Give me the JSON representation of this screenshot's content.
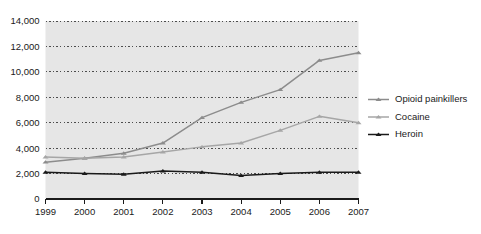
{
  "chart_data": {
    "type": "line",
    "title": "",
    "subtitle": "",
    "xlabel": "",
    "ylabel": "",
    "x": [
      1999,
      2000,
      2001,
      2002,
      2003,
      2004,
      2005,
      2006,
      2007
    ],
    "categories": [
      "1999",
      "2000",
      "2001",
      "2002",
      "2003",
      "2004",
      "2005",
      "2006",
      "2007"
    ],
    "series": [
      {
        "name": "Opioid painkillers",
        "color": "#8c8c8c",
        "marker": "triangle",
        "values": [
          2900,
          3200,
          3600,
          4400,
          6400,
          7600,
          8600,
          10900,
          11500
        ]
      },
      {
        "name": "Cocaine",
        "color": "#a6a6a6",
        "marker": "triangle",
        "values": [
          3300,
          3200,
          3300,
          3700,
          4100,
          4400,
          5400,
          6500,
          6000
        ]
      },
      {
        "name": "Heroin",
        "color": "#1a1a1a",
        "marker": "triangle",
        "values": [
          2100,
          2000,
          1950,
          2200,
          2100,
          1850,
          2000,
          2100,
          2100
        ]
      }
    ],
    "ylim": [
      0,
      14000
    ],
    "yticks": [
      0,
      2000,
      4000,
      6000,
      8000,
      10000,
      12000,
      14000
    ],
    "ytick_labels": [
      "0",
      "2,000",
      "4,000",
      "6,000",
      "8,000",
      "10,000",
      "12,000",
      "14,000"
    ],
    "xtick_labels": [
      "1999",
      "2000",
      "2001",
      "2002",
      "2003",
      "2004",
      "2005",
      "2006",
      "2007"
    ],
    "grid": true,
    "grid_style": "dotted",
    "grid_color": "#4d4d4d",
    "plot_background": "#e6e6e6",
    "legend_position": "right",
    "legend": [
      "Opioid painkillers",
      "Cocaine",
      "Heroin"
    ]
  }
}
